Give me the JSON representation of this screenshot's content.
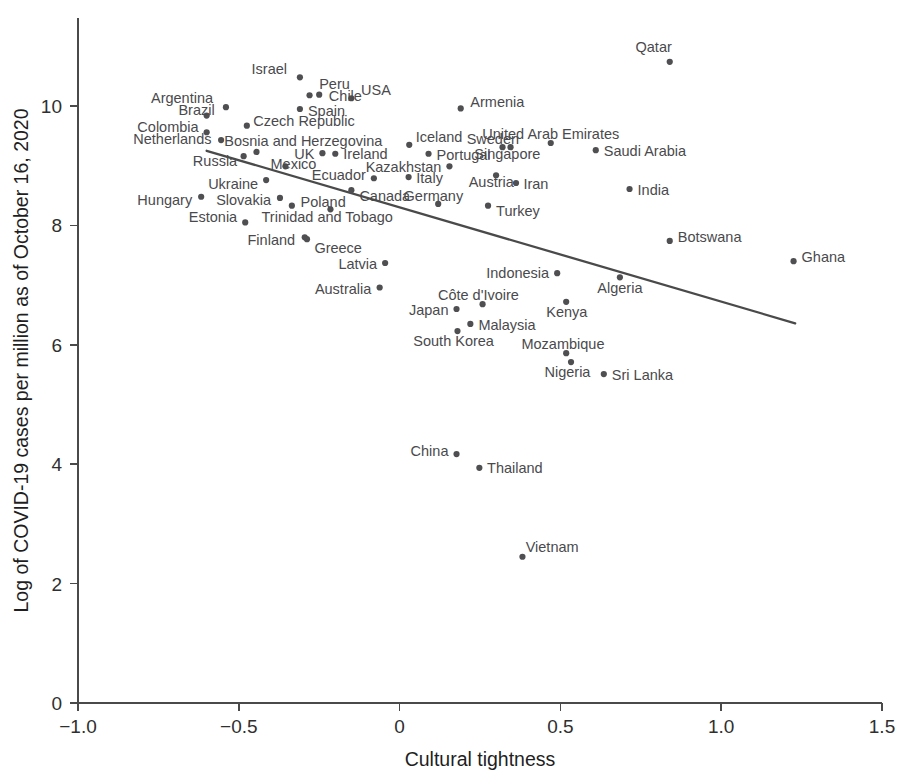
{
  "chart_data": {
    "type": "scatter",
    "title": "",
    "xlabel": "Cultural tightness",
    "ylabel": "Log of COVID-19 cases per million as of October 16, 2020",
    "xlim": [
      -1.0,
      1.5
    ],
    "ylim": [
      0,
      11.4
    ],
    "xticks": [
      "-1.0",
      "-0.5",
      "0",
      "0.5",
      "1.0",
      "1.5"
    ],
    "xtick_values": [
      -1.0,
      -0.5,
      0,
      0.5,
      1.0,
      1.5
    ],
    "yticks": [
      "0",
      "2",
      "4",
      "6",
      "8",
      "10"
    ],
    "ytick_values": [
      0,
      2,
      4,
      6,
      8,
      10
    ],
    "grid": false,
    "legend": "none",
    "point_color": "#4f4f52",
    "line_color": "#4a4a4a",
    "trendline": {
      "label": "linear fit",
      "x_start": -0.6,
      "y_start": 9.25,
      "x_end": 1.23,
      "y_end": 6.36
    },
    "points": [
      {
        "label": "Qatar",
        "x": 0.84,
        "y": 10.74,
        "lx": 0.79,
        "ly": 10.98,
        "anchor": "middle"
      },
      {
        "label": "Israel",
        "x": -0.31,
        "y": 10.48,
        "lx": -0.35,
        "ly": 10.62,
        "anchor": "end"
      },
      {
        "label": "Peru",
        "x": -0.28,
        "y": 10.18,
        "lx": -0.25,
        "ly": 10.37,
        "anchor": "start"
      },
      {
        "label": "Chile",
        "x": -0.25,
        "y": 10.19,
        "lx": -0.22,
        "ly": 10.16,
        "anchor": "start"
      },
      {
        "label": "USA",
        "x": -0.15,
        "y": 10.13,
        "lx": -0.12,
        "ly": 10.27,
        "anchor": "start"
      },
      {
        "label": "Argentina",
        "x": -0.54,
        "y": 9.98,
        "lx": -0.58,
        "ly": 10.14,
        "anchor": "end"
      },
      {
        "label": "Armenia",
        "x": 0.19,
        "y": 9.96,
        "lx": 0.22,
        "ly": 10.07,
        "anchor": "start"
      },
      {
        "label": "Brazil",
        "x": -0.6,
        "y": 9.84,
        "lx": -0.575,
        "ly": 9.93,
        "anchor": "end"
      },
      {
        "label": "Spain",
        "x": -0.31,
        "y": 9.95,
        "lx": -0.285,
        "ly": 9.91,
        "anchor": "start"
      },
      {
        "label": "Czech Republic",
        "x": -0.475,
        "y": 9.67,
        "lx": -0.455,
        "ly": 9.75,
        "anchor": "start"
      },
      {
        "label": "Colombia",
        "x": -0.6,
        "y": 9.56,
        "lx": -0.625,
        "ly": 9.64,
        "anchor": "end"
      },
      {
        "label": "Iceland",
        "x": 0.03,
        "y": 9.35,
        "lx": 0.05,
        "ly": 9.48,
        "anchor": "start"
      },
      {
        "label": "United Arab Emirates",
        "x": 0.47,
        "y": 9.38,
        "lx": 0.47,
        "ly": 9.53,
        "anchor": "middle"
      },
      {
        "label": "Netherlands",
        "x": -0.555,
        "y": 9.43,
        "lx": -0.585,
        "ly": 9.45,
        "anchor": "end"
      },
      {
        "label": "Bosnia and Herzegovina",
        "x": -0.445,
        "y": 9.23,
        "lx": -0.545,
        "ly": 9.42,
        "anchor": "start"
      },
      {
        "label": "Sweden",
        "x": 0.32,
        "y": 9.31,
        "lx": 0.29,
        "ly": 9.45,
        "anchor": "middle"
      },
      {
        "label": "Singapore",
        "x": 0.345,
        "y": 9.31,
        "lx": 0.335,
        "ly": 9.2,
        "anchor": "middle"
      },
      {
        "label": "Saudi Arabia",
        "x": 0.61,
        "y": 9.26,
        "lx": 0.635,
        "ly": 9.24,
        "anchor": "start"
      },
      {
        "label": "Portugal",
        "x": 0.09,
        "y": 9.2,
        "lx": 0.115,
        "ly": 9.18,
        "anchor": "start"
      },
      {
        "label": "Russia",
        "x": -0.485,
        "y": 9.16,
        "lx": -0.505,
        "ly": 9.08,
        "anchor": "end"
      },
      {
        "label": "UK",
        "x": -0.24,
        "y": 9.21,
        "lx": -0.265,
        "ly": 9.2,
        "anchor": "end"
      },
      {
        "label": "Ireland",
        "x": -0.2,
        "y": 9.2,
        "lx": -0.175,
        "ly": 9.19,
        "anchor": "start"
      },
      {
        "label": "Kazakhstan",
        "x": 0.155,
        "y": 8.99,
        "lx": 0.13,
        "ly": 8.98,
        "anchor": "end"
      },
      {
        "label": "Mexico",
        "x": -0.355,
        "y": 8.99,
        "lx": -0.33,
        "ly": 9.03,
        "anchor": "middle"
      },
      {
        "label": "Ecuador",
        "x": -0.08,
        "y": 8.79,
        "lx": -0.105,
        "ly": 8.85,
        "anchor": "end"
      },
      {
        "label": "Italy",
        "x": 0.028,
        "y": 8.81,
        "lx": 0.052,
        "ly": 8.79,
        "anchor": "start"
      },
      {
        "label": "Austria",
        "x": 0.3,
        "y": 8.84,
        "lx": 0.285,
        "ly": 8.72,
        "anchor": "middle"
      },
      {
        "label": "Iran",
        "x": 0.362,
        "y": 8.71,
        "lx": 0.385,
        "ly": 8.7,
        "anchor": "start"
      },
      {
        "label": "India",
        "x": 0.715,
        "y": 8.61,
        "lx": 0.74,
        "ly": 8.6,
        "anchor": "start"
      },
      {
        "label": "Ukraine",
        "x": -0.415,
        "y": 8.76,
        "lx": -0.44,
        "ly": 8.7,
        "anchor": "end"
      },
      {
        "label": "Canada",
        "x": -0.15,
        "y": 8.59,
        "lx": -0.125,
        "ly": 8.5,
        "anchor": "start"
      },
      {
        "label": "Germany",
        "x": 0.12,
        "y": 8.36,
        "lx": 0.105,
        "ly": 8.5,
        "anchor": "middle"
      },
      {
        "label": "Hungary",
        "x": -0.617,
        "y": 8.48,
        "lx": -0.645,
        "ly": 8.43,
        "anchor": "end"
      },
      {
        "label": "Slovakia",
        "x": -0.372,
        "y": 8.46,
        "lx": -0.4,
        "ly": 8.43,
        "anchor": "end"
      },
      {
        "label": "Poland",
        "x": -0.335,
        "y": 8.33,
        "lx": -0.308,
        "ly": 8.39,
        "anchor": "start"
      },
      {
        "label": "Turkey",
        "x": 0.275,
        "y": 8.33,
        "lx": 0.3,
        "ly": 8.24,
        "anchor": "start"
      },
      {
        "label": "Trinidad and Tobago",
        "x": -0.215,
        "y": 8.27,
        "lx": -0.225,
        "ly": 8.14,
        "anchor": "middle"
      },
      {
        "label": "Estonia",
        "x": -0.48,
        "y": 8.05,
        "lx": -0.505,
        "ly": 8.14,
        "anchor": "end"
      },
      {
        "label": "Botswana",
        "x": 0.84,
        "y": 7.74,
        "lx": 0.865,
        "ly": 7.8,
        "anchor": "start"
      },
      {
        "label": "Finland",
        "x": -0.295,
        "y": 7.8,
        "lx": -0.325,
        "ly": 7.75,
        "anchor": "end"
      },
      {
        "label": "Greece",
        "x": -0.288,
        "y": 7.77,
        "lx": -0.265,
        "ly": 7.62,
        "anchor": "start"
      },
      {
        "label": "Ghana",
        "x": 1.225,
        "y": 7.4,
        "lx": 1.25,
        "ly": 7.47,
        "anchor": "start"
      },
      {
        "label": "Latvia",
        "x": -0.045,
        "y": 7.37,
        "lx": -0.07,
        "ly": 7.35,
        "anchor": "end"
      },
      {
        "label": "Indonesia",
        "x": 0.49,
        "y": 7.2,
        "lx": 0.465,
        "ly": 7.21,
        "anchor": "end"
      },
      {
        "label": "Algeria",
        "x": 0.685,
        "y": 7.13,
        "lx": 0.685,
        "ly": 6.95,
        "anchor": "middle"
      },
      {
        "label": "Australia",
        "x": -0.062,
        "y": 6.96,
        "lx": -0.088,
        "ly": 6.94,
        "anchor": "end"
      },
      {
        "label": "Côte d'Ivoire",
        "x": 0.258,
        "y": 6.68,
        "lx": 0.245,
        "ly": 6.83,
        "anchor": "middle"
      },
      {
        "label": "Kenya",
        "x": 0.518,
        "y": 6.72,
        "lx": 0.52,
        "ly": 6.55,
        "anchor": "middle"
      },
      {
        "label": "Japan",
        "x": 0.177,
        "y": 6.6,
        "lx": 0.152,
        "ly": 6.58,
        "anchor": "end"
      },
      {
        "label": "Malaysia",
        "x": 0.22,
        "y": 6.35,
        "lx": 0.245,
        "ly": 6.34,
        "anchor": "start"
      },
      {
        "label": "South Korea",
        "x": 0.18,
        "y": 6.23,
        "lx": 0.168,
        "ly": 6.07,
        "anchor": "middle"
      },
      {
        "label": "Mozambique",
        "x": 0.518,
        "y": 5.86,
        "lx": 0.508,
        "ly": 6.01,
        "anchor": "middle"
      },
      {
        "label": "Nigeria",
        "x": 0.533,
        "y": 5.71,
        "lx": 0.522,
        "ly": 5.55,
        "anchor": "middle"
      },
      {
        "label": "Sri Lanka",
        "x": 0.635,
        "y": 5.51,
        "lx": 0.66,
        "ly": 5.5,
        "anchor": "start"
      },
      {
        "label": "China",
        "x": 0.177,
        "y": 4.17,
        "lx": 0.152,
        "ly": 4.22,
        "anchor": "end"
      },
      {
        "label": "Thailand",
        "x": 0.248,
        "y": 3.94,
        "lx": 0.272,
        "ly": 3.93,
        "anchor": "start"
      },
      {
        "label": "Vietnam",
        "x": 0.382,
        "y": 2.45,
        "lx": 0.392,
        "ly": 2.62,
        "anchor": "start"
      }
    ]
  }
}
